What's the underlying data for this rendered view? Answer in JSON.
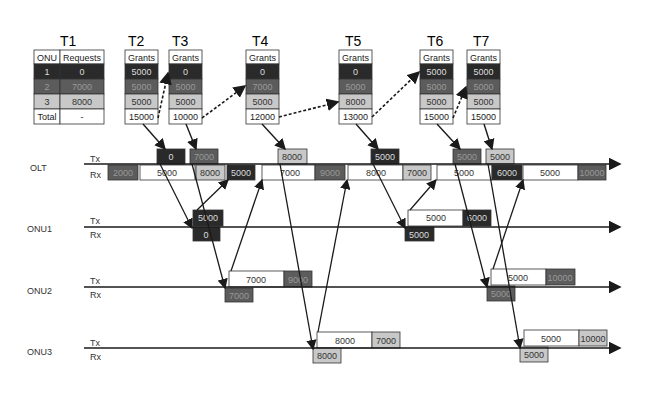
{
  "colors": {
    "onu1": "#2a2a2a",
    "onu2": "#5c5c5c",
    "onu3": "#c8c8c8",
    "white": "#ffffff",
    "line": "#1a1a1a"
  },
  "time_labels": [
    "T1",
    "T2",
    "T3",
    "T4",
    "T5",
    "T6",
    "T7"
  ],
  "request_table": {
    "title": "T1",
    "headers": [
      "ONU",
      "Requests"
    ],
    "rows": [
      {
        "onu": "1",
        "value": "0"
      },
      {
        "onu": "2",
        "value": "7000"
      },
      {
        "onu": "3",
        "value": "8000"
      },
      {
        "onu": "Total",
        "value": "-"
      }
    ]
  },
  "grant_tables": [
    {
      "label": "T2",
      "header": "Grants",
      "values": [
        "5000",
        "5000",
        "5000",
        "15000"
      ]
    },
    {
      "label": "T3",
      "header": "Grants",
      "values": [
        "0",
        "5000",
        "5000",
        "10000"
      ]
    },
    {
      "label": "T4",
      "header": "Grants",
      "values": [
        "0",
        "7000",
        "5000",
        "12000"
      ]
    },
    {
      "label": "T5",
      "header": "Grants",
      "values": [
        "0",
        "5000",
        "8000",
        "13000"
      ]
    },
    {
      "label": "T6",
      "header": "Grants",
      "values": [
        "5000",
        "5000",
        "5000",
        "15000"
      ]
    },
    {
      "label": "T7",
      "header": "Grants",
      "values": [
        "5000",
        "5000",
        "5000",
        "15000"
      ]
    }
  ],
  "nodes": [
    {
      "name": "OLT",
      "tx": "Tx",
      "rx": "Rx"
    },
    {
      "name": "ONU1",
      "tx": "Tx",
      "rx": "Rx"
    },
    {
      "name": "ONU2",
      "tx": "Tx",
      "rx": "Rx"
    },
    {
      "name": "ONU3",
      "tx": "Tx",
      "rx": "Rx"
    }
  ],
  "olt_tx_blocks": [
    "0",
    "7000",
    "8000",
    "5000",
    "5000",
    "5000"
  ],
  "olt_rx_blocks": [
    "2000",
    "5000",
    "8000",
    "5000",
    "7000",
    "9000",
    "8000",
    "7000",
    "5000",
    "6000",
    "5000",
    "10000"
  ],
  "onu1_blocks": {
    "rx": [
      "0",
      "5000"
    ],
    "tx": [
      "5000",
      "5000",
      "6000"
    ]
  },
  "onu2_blocks": {
    "rx": [
      "7000",
      "5000"
    ],
    "tx": [
      "7000",
      "9000",
      "5000",
      "10000"
    ]
  },
  "onu3_blocks": {
    "rx": [
      "8000",
      "5000"
    ],
    "tx": [
      "8000",
      "7000",
      "5000",
      "10000"
    ]
  }
}
